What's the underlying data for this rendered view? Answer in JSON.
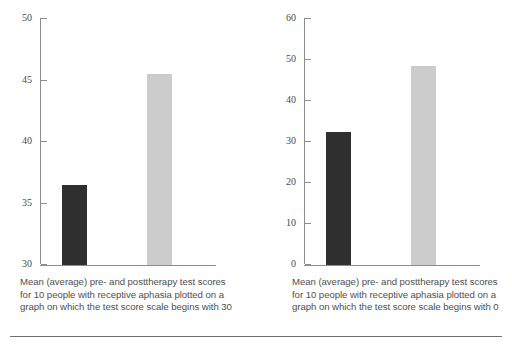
{
  "figure": {
    "background": "#ffffff",
    "bar_dark_color": "#2f2f2f",
    "bar_light_color": "#cccccc",
    "axis_color": "#8c8c8c"
  },
  "chart_data": [
    {
      "type": "bar",
      "id": "left-chart",
      "title": "",
      "xlabel": "",
      "ylabel": "",
      "categories": [
        "pretherapy",
        "posttherapy"
      ],
      "values": [
        36.5,
        45.5
      ],
      "ylim": [
        30,
        50
      ],
      "yticks": [
        30,
        35,
        40,
        45,
        50
      ],
      "ytick_labels": [
        "30",
        "35",
        "40",
        "45",
        "50"
      ],
      "grid": false,
      "legend": "none",
      "bar_colors": [
        "#2f2f2f",
        "#cccccc"
      ],
      "caption": "Mean (average) pre- and posttherapy test scores for 10 people with receptive aphasia plotted on a graph on which the test score scale begins with 30"
    },
    {
      "type": "bar",
      "id": "right-chart",
      "title": "",
      "xlabel": "",
      "ylabel": "",
      "categories": [
        "pretherapy",
        "posttherapy"
      ],
      "values": [
        32.5,
        48.5
      ],
      "ylim": [
        0,
        60
      ],
      "yticks": [
        0,
        10,
        20,
        30,
        40,
        50,
        60
      ],
      "ytick_labels": [
        "0",
        "10",
        "20",
        "30",
        "40",
        "50",
        "60"
      ],
      "grid": false,
      "legend": "none",
      "bar_colors": [
        "#2f2f2f",
        "#cccccc"
      ],
      "caption": "Mean (average) pre- and posttherapy test scores for 10 people with receptive aphasia plotted on a graph on which the test score scale begins with 0"
    }
  ]
}
